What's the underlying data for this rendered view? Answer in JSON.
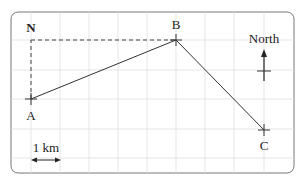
{
  "diagram": {
    "type": "bearing-map",
    "grid": {
      "cell_px": 29.2,
      "columns": 10,
      "rows": 5
    },
    "points": [
      {
        "id": "A",
        "label": "A",
        "x": 31,
        "y": 99
      },
      {
        "id": "B",
        "label": "B",
        "x": 176,
        "y": 40
      },
      {
        "id": "C",
        "label": "C",
        "x": 264,
        "y": 130
      },
      {
        "id": "N",
        "label": "N",
        "x": 31,
        "y": 40
      }
    ],
    "paths": [
      {
        "from": "A",
        "to": "B",
        "style": "solid"
      },
      {
        "from": "B",
        "to": "C",
        "style": "solid"
      },
      {
        "from": "A",
        "to": "N",
        "style": "dashed"
      },
      {
        "from": "N",
        "to": "B",
        "style": "dashed"
      }
    ],
    "north_indicator": {
      "label": "North"
    },
    "scale": {
      "label": "1 km"
    },
    "colors": {
      "line": "#333333",
      "grid": "#dcdcdc",
      "border": "#777777"
    }
  }
}
